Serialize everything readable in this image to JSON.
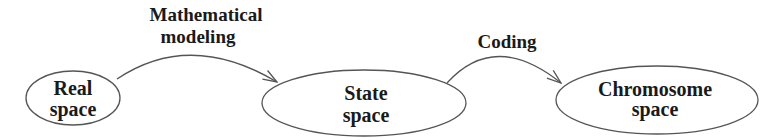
{
  "diagram": {
    "nodes": [
      {
        "id": "real",
        "line1": "Real",
        "line2": "space"
      },
      {
        "id": "state",
        "line1": "State",
        "line2": "space"
      },
      {
        "id": "chromosome",
        "line1": "Chromosome",
        "line2": "space"
      }
    ],
    "edges": [
      {
        "from": "real",
        "to": "state",
        "line1": "Mathematical",
        "line2": "modeling"
      },
      {
        "from": "state",
        "to": "chromosome",
        "line1": "Coding"
      }
    ],
    "colors": {
      "stroke": "#555555",
      "text": "#1a1a1a",
      "background": "#ffffff"
    }
  }
}
